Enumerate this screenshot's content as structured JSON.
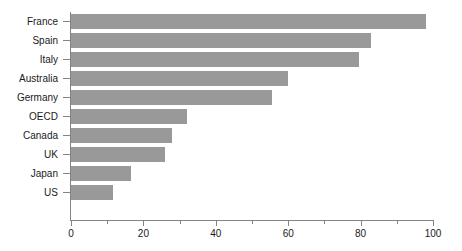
{
  "chart_data": {
    "type": "bar",
    "orientation": "horizontal",
    "title": "",
    "subtitle": "",
    "xlabel": "",
    "ylabel": "",
    "categories": [
      "France",
      "Spain",
      "Italy",
      "Australia",
      "Germany",
      "OECD",
      "Canada",
      "UK",
      "Japan",
      "US"
    ],
    "values": [
      98,
      83,
      79.5,
      60,
      55.5,
      32,
      28,
      26,
      16.5,
      11.5
    ],
    "series": [
      {
        "name": "",
        "values": [
          98,
          83,
          79.5,
          60,
          55.5,
          32,
          28,
          26,
          16.5,
          11.5
        ]
      }
    ],
    "xlim": [
      0,
      100
    ],
    "xticks": [
      0,
      20,
      40,
      60,
      80,
      100
    ],
    "xtick_labels": [
      "0",
      "20",
      "40",
      "60",
      "80",
      "100"
    ],
    "xticks_minor": [
      10,
      30,
      50,
      70,
      90
    ],
    "grid": false,
    "legend": false,
    "legend_position": "none",
    "annotations": [],
    "bar_color": "#999999",
    "axis_color": "#848484",
    "text_color": "#1a1a1a",
    "background_color": "#ffffff"
  }
}
